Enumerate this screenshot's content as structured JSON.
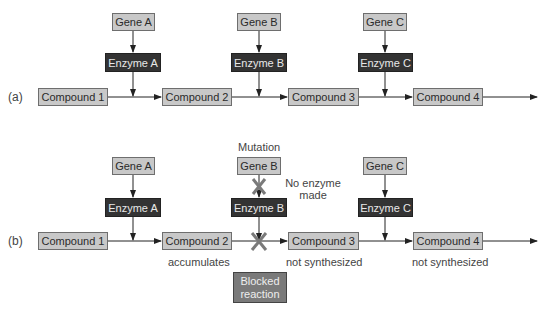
{
  "panel_a": {
    "label": "(a)",
    "genes": [
      "Gene A",
      "Gene B",
      "Gene C"
    ],
    "enzymes": [
      "Enzyme A",
      "Enzyme B",
      "Enzyme C"
    ],
    "compounds": [
      "Compound 1",
      "Compound 2",
      "Compound 3",
      "Compound 4"
    ]
  },
  "panel_b": {
    "label": "(b)",
    "genes": [
      "Gene A",
      "Gene B",
      "Gene C"
    ],
    "enzymes": [
      "Enzyme A",
      "Enzyme B",
      "Enzyme C"
    ],
    "compounds": [
      "Compound 1",
      "Compound 2",
      "Compound 3",
      "Compound 4"
    ],
    "mutation_label": "Mutation",
    "no_enzyme_label_line1": "No enzyme",
    "no_enzyme_label_line2": "made",
    "compound_notes": [
      "accumulates",
      "not synthesized",
      "not synthesized"
    ],
    "blocked_line1": "Blocked",
    "blocked_line2": "reaction"
  },
  "colors": {
    "gene_fill": "#c8c8c8",
    "enzyme_fill": "#333333",
    "blocked_fill": "#7a7a7a",
    "cross": "#7a7a7a",
    "arrow": "#222222"
  }
}
